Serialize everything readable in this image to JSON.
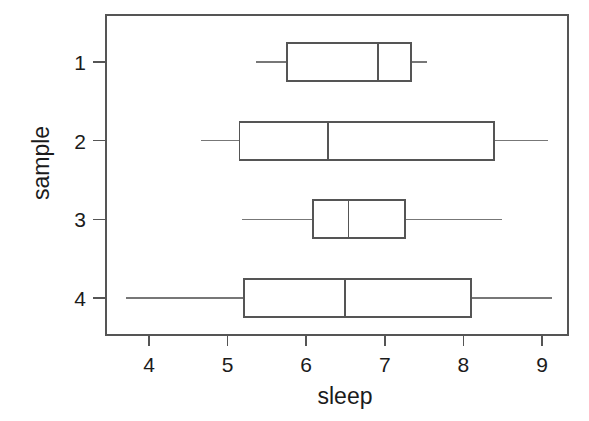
{
  "chart_data": {
    "type": "boxplot",
    "orientation": "horizontal",
    "title": "",
    "xlabel": "sleep",
    "ylabel": "sample",
    "xlim": [
      3.37,
      9.7
    ],
    "xticks": [
      4,
      5,
      6,
      7,
      8,
      9
    ],
    "xtick_labels": [
      "4",
      "5",
      "6",
      "7",
      "8",
      "9"
    ],
    "yticks": [
      1,
      2,
      3,
      4
    ],
    "ytick_labels": [
      "1",
      "2",
      "3",
      "4"
    ],
    "grid": false,
    "legend": "none",
    "box_color": "#555555",
    "whisker_color": "#777777",
    "background": "#ffffff",
    "boxes": [
      {
        "label": "1",
        "category": 1,
        "whisker_low": 5.36,
        "q1": 5.76,
        "median": 6.91,
        "q3": 7.33,
        "whisker_high": 7.54
      },
      {
        "label": "2",
        "category": 2,
        "whisker_low": 4.66,
        "q1": 5.15,
        "median": 6.28,
        "q3": 8.39,
        "whisker_high": 9.08
      },
      {
        "label": "3",
        "category": 3,
        "whisker_low": 5.18,
        "q1": 6.09,
        "median": 6.54,
        "q3": 7.26,
        "whisker_high": 8.49
      },
      {
        "label": "4",
        "category": 4,
        "whisker_low": 3.71,
        "q1": 5.21,
        "median": 6.49,
        "q3": 8.1,
        "whisker_high": 9.13
      }
    ]
  }
}
